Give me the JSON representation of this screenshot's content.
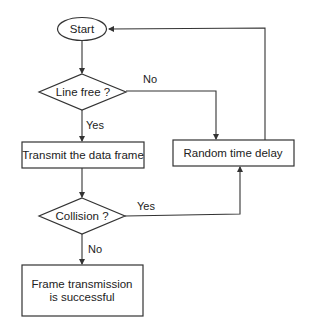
{
  "diagram": {
    "type": "flowchart",
    "title": "",
    "nodes": {
      "start": {
        "label": "Start",
        "shape": "ellipse"
      },
      "line_free": {
        "label": "Line free ?",
        "shape": "diamond"
      },
      "transmit": {
        "label": "Transmit the data frame",
        "shape": "rect"
      },
      "collision": {
        "label": "Collision ?",
        "shape": "diamond"
      },
      "delay": {
        "label": "Random time delay",
        "shape": "rect"
      },
      "success": {
        "label_line1": "Frame transmission",
        "label_line2": "is successful",
        "shape": "rect"
      }
    },
    "edges": [
      {
        "from": "start",
        "to": "line_free",
        "label": ""
      },
      {
        "from": "line_free",
        "to": "transmit",
        "label": "Yes"
      },
      {
        "from": "line_free",
        "to": "delay",
        "label": "No"
      },
      {
        "from": "transmit",
        "to": "collision",
        "label": ""
      },
      {
        "from": "collision",
        "to": "delay",
        "label": "Yes"
      },
      {
        "from": "collision",
        "to": "success",
        "label": "No"
      },
      {
        "from": "delay",
        "to": "start",
        "label": ""
      }
    ],
    "edge_labels": {
      "line_free_yes": "Yes",
      "line_free_no": "No",
      "collision_yes": "Yes",
      "collision_no": "No"
    },
    "colors": {
      "stroke": "#333333",
      "text": "#222222",
      "background": "#ffffff"
    }
  }
}
